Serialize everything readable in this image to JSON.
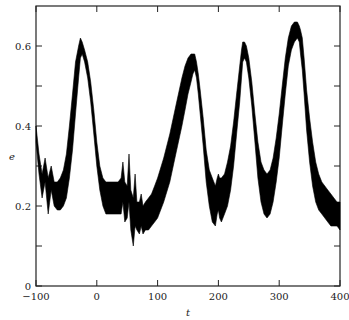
{
  "chart_data": {
    "type": "line",
    "title": "",
    "xlabel": "t",
    "ylabel": "e",
    "xlim": [
      -100,
      400
    ],
    "ylim": [
      0,
      0.7
    ],
    "x_ticks": [
      "-100",
      "0",
      "100",
      "200",
      "300",
      "400"
    ],
    "y_ticks": [
      "0",
      "0.2",
      "0.4",
      "0.6"
    ],
    "grid": false,
    "legend": null,
    "series": [
      {
        "name": "e(t) band",
        "t": [
          -100,
          -95,
          -90,
          -85,
          -80,
          -75,
          -70,
          -65,
          -60,
          -55,
          -50,
          -45,
          -40,
          -35,
          -30,
          -27,
          -24,
          -20,
          -15,
          -10,
          -5,
          0,
          5,
          10,
          15,
          20,
          25,
          30,
          35,
          40,
          43,
          46,
          50,
          53,
          56,
          60,
          63,
          66,
          70,
          73,
          76,
          80,
          85,
          90,
          95,
          100,
          110,
          120,
          130,
          140,
          145,
          150,
          155,
          158,
          161,
          164,
          167,
          170,
          175,
          180,
          185,
          190,
          195,
          198,
          200,
          202,
          205,
          210,
          215,
          220,
          225,
          230,
          235,
          238,
          240,
          243,
          246,
          250,
          255,
          260,
          265,
          270,
          275,
          280,
          285,
          290,
          295,
          300,
          305,
          310,
          315,
          320,
          325,
          330,
          333,
          335,
          338,
          341,
          345,
          350,
          355,
          360,
          365,
          370,
          375,
          380,
          385,
          390,
          395,
          400
        ],
        "upper": [
          0.4,
          0.33,
          0.28,
          0.32,
          0.27,
          0.3,
          0.26,
          0.26,
          0.27,
          0.29,
          0.33,
          0.4,
          0.48,
          0.56,
          0.6,
          0.62,
          0.61,
          0.59,
          0.56,
          0.51,
          0.44,
          0.36,
          0.3,
          0.27,
          0.26,
          0.26,
          0.26,
          0.26,
          0.26,
          0.27,
          0.31,
          0.26,
          0.25,
          0.33,
          0.24,
          0.22,
          0.28,
          0.21,
          0.21,
          0.23,
          0.2,
          0.21,
          0.22,
          0.23,
          0.25,
          0.27,
          0.32,
          0.38,
          0.45,
          0.52,
          0.55,
          0.57,
          0.58,
          0.58,
          0.58,
          0.56,
          0.53,
          0.49,
          0.42,
          0.34,
          0.29,
          0.27,
          0.25,
          0.27,
          0.28,
          0.27,
          0.27,
          0.28,
          0.31,
          0.35,
          0.41,
          0.48,
          0.55,
          0.59,
          0.61,
          0.61,
          0.6,
          0.57,
          0.51,
          0.43,
          0.36,
          0.31,
          0.29,
          0.28,
          0.29,
          0.32,
          0.37,
          0.43,
          0.5,
          0.57,
          0.62,
          0.65,
          0.66,
          0.66,
          0.65,
          0.64,
          0.62,
          0.57,
          0.49,
          0.42,
          0.36,
          0.31,
          0.28,
          0.26,
          0.25,
          0.24,
          0.23,
          0.22,
          0.21,
          0.21
        ],
        "lower": [
          0.36,
          0.28,
          0.22,
          0.26,
          0.18,
          0.24,
          0.2,
          0.19,
          0.19,
          0.2,
          0.22,
          0.27,
          0.34,
          0.43,
          0.52,
          0.57,
          0.58,
          0.56,
          0.52,
          0.46,
          0.38,
          0.3,
          0.24,
          0.2,
          0.18,
          0.18,
          0.18,
          0.18,
          0.18,
          0.18,
          0.21,
          0.16,
          0.17,
          0.21,
          0.14,
          0.1,
          0.15,
          0.14,
          0.13,
          0.15,
          0.13,
          0.14,
          0.14,
          0.15,
          0.16,
          0.17,
          0.21,
          0.26,
          0.33,
          0.4,
          0.44,
          0.48,
          0.51,
          0.53,
          0.54,
          0.52,
          0.48,
          0.43,
          0.35,
          0.26,
          0.2,
          0.16,
          0.15,
          0.18,
          0.19,
          0.17,
          0.16,
          0.18,
          0.2,
          0.24,
          0.3,
          0.38,
          0.46,
          0.52,
          0.56,
          0.57,
          0.56,
          0.52,
          0.45,
          0.36,
          0.27,
          0.21,
          0.18,
          0.17,
          0.18,
          0.21,
          0.26,
          0.32,
          0.4,
          0.48,
          0.55,
          0.59,
          0.61,
          0.62,
          0.61,
          0.58,
          0.54,
          0.48,
          0.39,
          0.31,
          0.25,
          0.21,
          0.19,
          0.18,
          0.17,
          0.16,
          0.15,
          0.15,
          0.15,
          0.14
        ]
      }
    ],
    "annotations": []
  },
  "axes": {
    "x_label": "t",
    "y_label": "e",
    "x_ticks": [
      "-100",
      "0",
      "100",
      "200",
      "300",
      "400"
    ],
    "y_ticks": [
      "0",
      "0.2",
      "0.4",
      "0.6"
    ],
    "line_color": "#111111",
    "band_color": "#000000"
  }
}
